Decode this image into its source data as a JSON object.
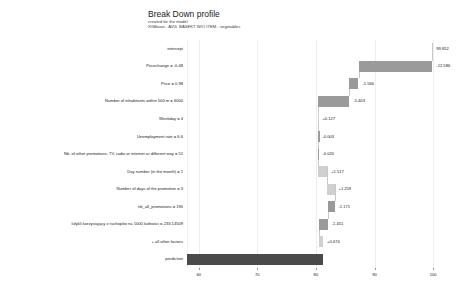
{
  "header": {
    "title": "Break Down profile",
    "subtitle_line1": "created for the  model",
    "subtitle_line2": "XGBoost - AVG. BASEKT W/O ITEM - vegetables"
  },
  "colors": {
    "negative_bar": "#9a9a9a",
    "positive_bar": "#d0d0d0",
    "total_bar": "#4a4a4a",
    "gridline": "#eceff1",
    "background": "#ffffff",
    "text": "#1a1a1a"
  },
  "chart_data": {
    "type": "bar",
    "subtype": "waterfall",
    "title": "Break Down profile",
    "subtitle": "created for the  model\nXGBoost - AVG. BASEKT W/O ITEM - vegetables",
    "xlabel": "",
    "ylabel": "",
    "orientation": "horizontal",
    "xlim": [
      58,
      101
    ],
    "xticks": [
      60,
      70,
      80,
      90,
      100
    ],
    "xtick_labels": [
      "60",
      "70",
      "80",
      "90",
      "100"
    ],
    "grid": true,
    "legend": false,
    "intercept": 99.852,
    "prediction": 81.229,
    "categories": [
      "intercept",
      "Pricechange = -0.48",
      "Price = 0.98",
      "Number of inhabitants within 500 m = 6000",
      "Weekday = 4",
      "Unemployment rate = 6.6",
      "Nb. of other promotions: TV, radio or internet or different way = 51",
      "Day number (in the month) = 1",
      "Number of days of the promotion = 3",
      "nb_all_promotions = 190",
      "lułykli korzystający z ruchopilw na 1000 ludności = 233,14509",
      "+ all other factors",
      "prediction"
    ],
    "values": [
      99.852,
      -12.586,
      -1.566,
      -5.403,
      0.127,
      -0.003,
      -0.02,
      1.517,
      1.259,
      -1.171,
      -1.451,
      0.674,
      81.229
    ],
    "value_labels": [
      "99.852",
      "-12.586",
      "-1.566",
      "-5.403",
      "+0.127",
      "-0.003",
      "-0.020",
      "+1.517",
      "+1.259",
      "-1.171",
      "-1.451",
      "+0.674",
      ""
    ],
    "bar_types": [
      "intercept",
      "negative",
      "negative",
      "negative",
      "positive",
      "negative",
      "negative",
      "positive",
      "positive",
      "negative",
      "negative",
      "positive",
      "total"
    ],
    "cumulative_start": [
      99.852,
      87.266,
      85.7,
      80.297,
      80.424,
      80.421,
      80.401,
      81.918,
      83.177,
      82.006,
      80.555,
      81.229,
      58.0
    ],
    "cumulative_end": [
      99.852,
      99.852,
      87.266,
      85.7,
      80.297,
      80.424,
      80.421,
      80.401,
      81.918,
      83.177,
      82.006,
      80.555,
      81.229
    ]
  }
}
